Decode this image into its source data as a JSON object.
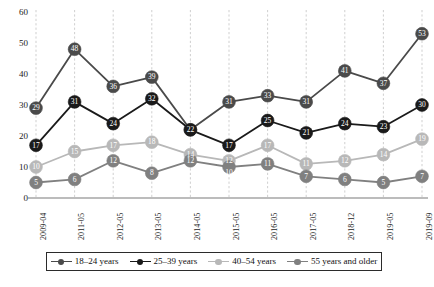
{
  "chart_data": {
    "type": "line",
    "title": "",
    "xlabel": "",
    "ylabel": "",
    "ylim": [
      0,
      60
    ],
    "yticks": [
      "0",
      "10",
      "20",
      "30",
      "40",
      "50",
      "60"
    ],
    "grid": "vertical-dashed",
    "legend_position": "bottom",
    "categories": [
      "2009-04",
      "2011-05",
      "2012-05",
      "2013-05",
      "2014-05",
      "2015-05",
      "2016-05",
      "2017-05",
      "2018-12",
      "2019-05",
      "2019-09"
    ],
    "series": [
      {
        "name": "18-24 years",
        "color": "#4a4a4a",
        "values": [
          29,
          48,
          36,
          39,
          22,
          31,
          33,
          31,
          41,
          37,
          53
        ]
      },
      {
        "name": "25-39 years",
        "color": "#1a1a1a",
        "values": [
          17,
          31,
          24,
          32,
          22,
          17,
          25,
          21,
          24,
          23,
          30
        ]
      },
      {
        "name": "40-54 years",
        "color": "#b8b8b8",
        "values": [
          10,
          15,
          17,
          18,
          14,
          12,
          17,
          11,
          12,
          14,
          19
        ]
      },
      {
        "name": "55 years and older",
        "color": "#808080",
        "values": [
          5,
          6,
          12,
          8,
          12,
          10,
          11,
          7,
          6,
          5,
          7
        ]
      }
    ]
  },
  "legend": {
    "items": [
      {
        "label": "18–24 years",
        "color": "#4a4a4a"
      },
      {
        "label": "25–39 years",
        "color": "#1a1a1a"
      },
      {
        "label": "40–54 years",
        "color": "#b8b8b8"
      },
      {
        "label": "55 years and older",
        "color": "#808080"
      }
    ]
  },
  "axis": {
    "y_tick_labels": [
      "60",
      "50",
      "40",
      "30",
      "20",
      "10",
      "0"
    ],
    "x_tick_labels": [
      "2009-04",
      "2011-05",
      "2012-05",
      "2013-05",
      "2014-05",
      "2015-05",
      "2016-05",
      "2017-05",
      "2018-12",
      "2019-05",
      "2019-09"
    ]
  }
}
